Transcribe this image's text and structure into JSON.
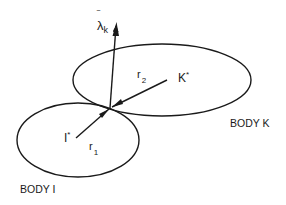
{
  "diagram": {
    "bodies": [
      {
        "id": "K",
        "label": "BODY K",
        "center_label": "K",
        "center_sup": "*"
      },
      {
        "id": "I",
        "label": "BODY I",
        "center_label": "I",
        "center_sup": "*"
      }
    ],
    "vectors": {
      "lambda": {
        "symbol": "λ",
        "bar": "‾",
        "subscript": "k"
      },
      "r2": {
        "symbol": "r",
        "subscript": "2"
      },
      "r1": {
        "symbol": "r",
        "subscript": "1"
      }
    },
    "colors": {
      "ink": "#1a1a1a",
      "background": "#ffffff"
    }
  }
}
